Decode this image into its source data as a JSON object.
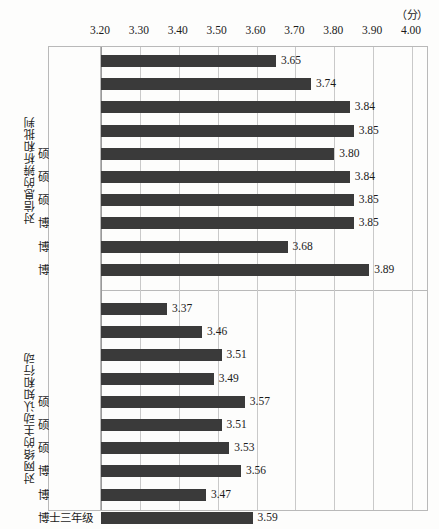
{
  "unit": {
    "label": "（分）"
  },
  "axis": {
    "ticks": [
      "3.20",
      "3.30",
      "3.40",
      "3.50",
      "3.60",
      "3.70",
      "3.80",
      "3.90",
      "4.00"
    ],
    "min": 3.2,
    "max": 4.0,
    "step": 0.1
  },
  "groups": [
    {
      "title": "对信息的辨析和批判",
      "categories": [
        "大一",
        "大二",
        "大三",
        "大四",
        "硕士一年级",
        "硕士二年级",
        "硕士三年级",
        "博士一年级",
        "博士二年级",
        "博士三年级"
      ],
      "values": [
        3.65,
        3.74,
        3.84,
        3.85,
        3.8,
        3.84,
        3.85,
        3.85,
        3.68,
        3.89
      ],
      "labels": [
        "3.65",
        "3.74",
        "3.84",
        "3.85",
        "3.80",
        "3.84",
        "3.85",
        "3.85",
        "3.68",
        "3.89"
      ]
    },
    {
      "title": "对网络的主动认知和行动",
      "categories": [
        "大一",
        "大二",
        "大三",
        "大四",
        "硕士一年级",
        "硕士二年级",
        "硕士三年级",
        "博士一年级",
        "博士二年级",
        "博士三年级"
      ],
      "values": [
        3.37,
        3.46,
        3.51,
        3.49,
        3.57,
        3.51,
        3.53,
        3.56,
        3.47,
        3.59
      ],
      "labels": [
        "3.37",
        "3.46",
        "3.51",
        "3.49",
        "3.57",
        "3.51",
        "3.53",
        "3.56",
        "3.47",
        "3.59"
      ]
    }
  ],
  "style": {
    "bar_color": "#3a3a3a",
    "grid_color": "#c9c9c9",
    "frame_color": "#b9b9b9",
    "background": "#fdfdfc",
    "text_color": "#1b1b1b"
  },
  "chart_data": {
    "type": "bar",
    "orientation": "horizontal",
    "title": "",
    "subtitle": "",
    "xlabel": "（分）",
    "ylabel": "",
    "xlim": [
      3.2,
      4.0
    ],
    "xticks": [
      3.2,
      3.3,
      3.4,
      3.5,
      3.6,
      3.7,
      3.8,
      3.9,
      4.0
    ],
    "grid": true,
    "legend": null,
    "panels": [
      {
        "ylabel": "对信息的辨析和批判",
        "categories": [
          "大一",
          "大二",
          "大三",
          "大四",
          "硕士一年级",
          "硕士二年级",
          "硕士三年级",
          "博士一年级",
          "博士二年级",
          "博士三年级"
        ],
        "values": [
          3.65,
          3.74,
          3.84,
          3.85,
          3.8,
          3.84,
          3.85,
          3.85,
          3.68,
          3.89
        ]
      },
      {
        "ylabel": "对网络的主动认知和行动",
        "categories": [
          "大一",
          "大二",
          "大三",
          "大四",
          "硕士一年级",
          "硕士二年级",
          "硕士三年级",
          "博士一年级",
          "博士二年级",
          "博士三年级"
        ],
        "values": [
          3.37,
          3.46,
          3.51,
          3.49,
          3.57,
          3.51,
          3.53,
          3.56,
          3.47,
          3.59
        ]
      }
    ]
  }
}
